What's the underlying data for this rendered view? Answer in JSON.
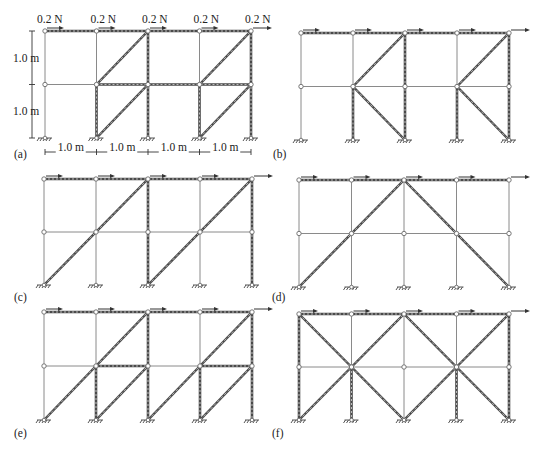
{
  "figure": {
    "loads": [
      "0.2 N",
      "0.2 N",
      "0.2 N",
      "0.2 N",
      "0.2 N"
    ],
    "dimensions": {
      "storey_heights": [
        "1.0 m",
        "1.0 m"
      ],
      "bay_widths": [
        "1.0 m",
        "1.0 m",
        "1.0 m",
        "1.0 m"
      ]
    },
    "colors": {
      "frame": "#8a8a8a",
      "active_member": "#4a4a4a",
      "background": "#ffffff"
    },
    "panels": [
      {
        "id": "a",
        "label": "(a)",
        "origin": [
          45,
          31
        ],
        "bay": 51.5,
        "storey": 53.5,
        "label_pos": [
          14,
          158
        ],
        "show_dimensions": true,
        "active_horizontal": [
          [
            0,
            0,
            4,
            0
          ],
          [
            1,
            1,
            4,
            1
          ]
        ],
        "active_vertical": [
          [
            2,
            0,
            2,
            2
          ],
          [
            4,
            0,
            4,
            2
          ],
          [
            1,
            1,
            1,
            2
          ],
          [
            3,
            1,
            3,
            2
          ]
        ],
        "diagonals": [
          [
            1,
            1,
            2,
            0
          ],
          [
            3,
            1,
            4,
            0
          ],
          [
            1,
            2,
            2,
            1
          ],
          [
            3,
            2,
            4,
            1
          ]
        ]
      },
      {
        "id": "b",
        "label": "(b)",
        "origin": [
          301,
          33
        ],
        "bay": 52,
        "storey": 53.5,
        "label_pos": [
          273,
          158
        ],
        "show_dimensions": false,
        "active_horizontal": [
          [
            0,
            0,
            4,
            0
          ]
        ],
        "active_vertical": [
          [
            2,
            0,
            2,
            2
          ],
          [
            4,
            0,
            4,
            2
          ],
          [
            1,
            1,
            1,
            2
          ],
          [
            3,
            1,
            3,
            2
          ]
        ],
        "diagonals": [
          [
            1,
            1,
            2,
            0
          ],
          [
            3,
            1,
            4,
            0
          ],
          [
            1,
            1,
            2,
            2
          ],
          [
            3,
            1,
            4,
            2
          ]
        ]
      },
      {
        "id": "c",
        "label": "(c)",
        "origin": [
          44,
          179
        ],
        "bay": 52,
        "storey": 53,
        "label_pos": [
          14,
          301
        ],
        "show_dimensions": false,
        "active_horizontal": [
          [
            0,
            0,
            4,
            0
          ]
        ],
        "active_vertical": [
          [
            2,
            0,
            2,
            2
          ],
          [
            4,
            0,
            4,
            2
          ]
        ],
        "diagonals": [
          [
            0,
            2,
            2,
            0
          ],
          [
            2,
            2,
            4,
            0
          ]
        ]
      },
      {
        "id": "d",
        "label": "(d)",
        "origin": [
          299,
          180
        ],
        "bay": 52.5,
        "storey": 53.5,
        "label_pos": [
          272,
          301
        ],
        "show_dimensions": false,
        "active_horizontal": [
          [
            0,
            0,
            4,
            0
          ]
        ],
        "active_vertical": [],
        "diagonals": [
          [
            0,
            2,
            2,
            0
          ],
          [
            2,
            0,
            4,
            2
          ]
        ]
      },
      {
        "id": "e",
        "label": "(e)",
        "origin": [
          44,
          312
        ],
        "bay": 52,
        "storey": 54,
        "label_pos": [
          14,
          437
        ],
        "show_dimensions": false,
        "active_horizontal": [
          [
            0,
            0,
            4,
            0
          ],
          [
            1,
            1,
            2,
            1
          ],
          [
            3,
            1,
            4,
            1
          ]
        ],
        "active_vertical": [
          [
            2,
            0,
            2,
            2
          ],
          [
            4,
            0,
            4,
            2
          ],
          [
            1,
            1,
            1,
            2
          ],
          [
            3,
            1,
            3,
            2
          ]
        ],
        "diagonals": [
          [
            0,
            2,
            2,
            0
          ],
          [
            2,
            2,
            4,
            0
          ],
          [
            1,
            2,
            2,
            1
          ],
          [
            3,
            2,
            4,
            1
          ]
        ]
      },
      {
        "id": "f",
        "label": "(f)",
        "origin": [
          299,
          314
        ],
        "bay": 52.5,
        "storey": 53,
        "label_pos": [
          272,
          437
        ],
        "show_dimensions": false,
        "active_horizontal": [
          [
            0,
            0,
            4,
            0
          ]
        ],
        "active_vertical": [
          [
            0,
            0,
            0,
            2
          ],
          [
            4,
            0,
            4,
            2
          ],
          [
            1,
            1,
            1,
            2
          ],
          [
            3,
            1,
            3,
            2
          ]
        ],
        "diagonals": [
          [
            0,
            0,
            2,
            2
          ],
          [
            0,
            2,
            2,
            0
          ],
          [
            2,
            0,
            4,
            2
          ],
          [
            2,
            2,
            4,
            0
          ]
        ]
      }
    ]
  }
}
